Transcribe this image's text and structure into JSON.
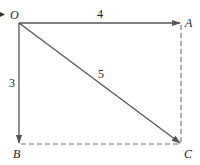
{
  "diagram": {
    "type": "vector-rectangle",
    "colors": {
      "stroke": "#555555",
      "text": "#222222",
      "background": "#ffffff"
    },
    "points": {
      "O": {
        "label": "O",
        "x": 19,
        "y": 23
      },
      "A": {
        "label": "A",
        "x": 181,
        "y": 23
      },
      "B": {
        "label": "B",
        "x": 19,
        "y": 144
      },
      "C": {
        "label": "C",
        "x": 181,
        "y": 144
      }
    },
    "vectors": [
      {
        "from": "O",
        "to": "A",
        "length_label": "4"
      },
      {
        "from": "O",
        "to": "B",
        "length_label": "3"
      },
      {
        "from": "O",
        "to": "C",
        "length_label": "5"
      }
    ],
    "dashed_segments": [
      {
        "from": "A",
        "to": "C"
      },
      {
        "from": "B",
        "to": "C"
      }
    ]
  }
}
